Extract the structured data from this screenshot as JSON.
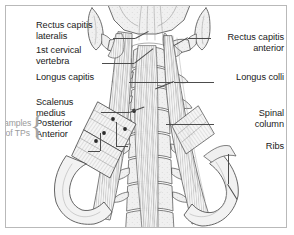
{
  "figure": {
    "type": "anatomical-illustration",
    "style": "grayscale pen-and-ink line drawing with hatching",
    "frame": {
      "border_color": "#b9b9b9",
      "background": "#ffffff"
    },
    "ink_colors": {
      "outline": "#3a3a3a",
      "hatching": "#8d8d8d",
      "fill_light": "#f2f2f2",
      "fill_mid": "#dcdcdc",
      "trigger_point": "#2b2b2b",
      "leader_line": "#4c4c4c",
      "text": "#1a1a1a",
      "annotation_gray": "#9a9a9a"
    }
  },
  "labels": {
    "left": [
      {
        "id": "rectus-capitis-lateralis",
        "lines": [
          "Rectus capitis",
          "lateralis"
        ]
      },
      {
        "id": "first-cervical-vertebra",
        "lines": [
          "1st cervical",
          "vertebra"
        ]
      },
      {
        "id": "longus-capitis",
        "lines": [
          "Longus capitis"
        ]
      },
      {
        "id": "scalenus-medius",
        "lines": [
          "Scalenus",
          "medius"
        ]
      },
      {
        "id": "scalenus-posterior",
        "lines": [
          "Posterior"
        ]
      },
      {
        "id": "scalenus-anterior",
        "lines": [
          "Anterior"
        ]
      }
    ],
    "right": [
      {
        "id": "rectus-capitis-anterior",
        "lines": [
          "Rectus capitis",
          "anterior"
        ]
      },
      {
        "id": "longus-colli",
        "lines": [
          "Longus colli"
        ]
      },
      {
        "id": "spinal-column",
        "lines": [
          "Spinal",
          "column"
        ]
      },
      {
        "id": "ribs",
        "lines": [
          "Ribs"
        ]
      }
    ],
    "annotation": {
      "id": "examples-of-tps",
      "lines": [
        "Examples",
        "of TPs"
      ],
      "color": "#9a9a9a",
      "brace": "{"
    }
  },
  "text": {
    "rectus_capitis_lateralis_l1": "Rectus capitis",
    "rectus_capitis_lateralis_l2": "lateralis",
    "first_cervical_vertebra_l1": "1st cervical",
    "first_cervical_vertebra_l2": "vertebra",
    "longus_capitis": "Longus capitis",
    "scalenus_l1": "Scalenus",
    "scalenus_l2": "medius",
    "scalenus_posterior": "Posterior",
    "scalenus_anterior": "Anterior",
    "rectus_capitis_anterior_l1": "Rectus capitis",
    "rectus_capitis_anterior_l2": "anterior",
    "longus_colli": "Longus colli",
    "spinal_column_l1": "Spinal",
    "spinal_column_l2": "column",
    "ribs": "Ribs",
    "examples_l1": "Examples",
    "examples_l2": "of TPs"
  },
  "trigger_points": [
    {
      "x": 112,
      "y": 118
    },
    {
      "x": 133,
      "y": 110
    },
    {
      "x": 103,
      "y": 132
    },
    {
      "x": 124,
      "y": 128
    },
    {
      "x": 95,
      "y": 140
    }
  ]
}
